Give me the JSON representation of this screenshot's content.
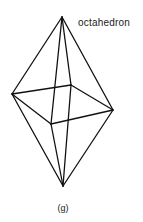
{
  "figure": {
    "label": "octahedron",
    "caption": "(g)",
    "stroke_color": "#111111",
    "vertices": {
      "top": [
        62,
        17
      ],
      "left": [
        12,
        94
      ],
      "back": [
        71,
        85
      ],
      "right": [
        113,
        110
      ],
      "front": [
        51,
        124
      ],
      "bottom": [
        63,
        186
      ]
    },
    "edges": [
      [
        "top",
        "left"
      ],
      [
        "top",
        "back"
      ],
      [
        "top",
        "right"
      ],
      [
        "top",
        "front"
      ],
      [
        "bottom",
        "left"
      ],
      [
        "bottom",
        "back"
      ],
      [
        "bottom",
        "right"
      ],
      [
        "bottom",
        "front"
      ],
      [
        "left",
        "back"
      ],
      [
        "back",
        "right"
      ],
      [
        "right",
        "front"
      ],
      [
        "front",
        "left"
      ]
    ]
  }
}
